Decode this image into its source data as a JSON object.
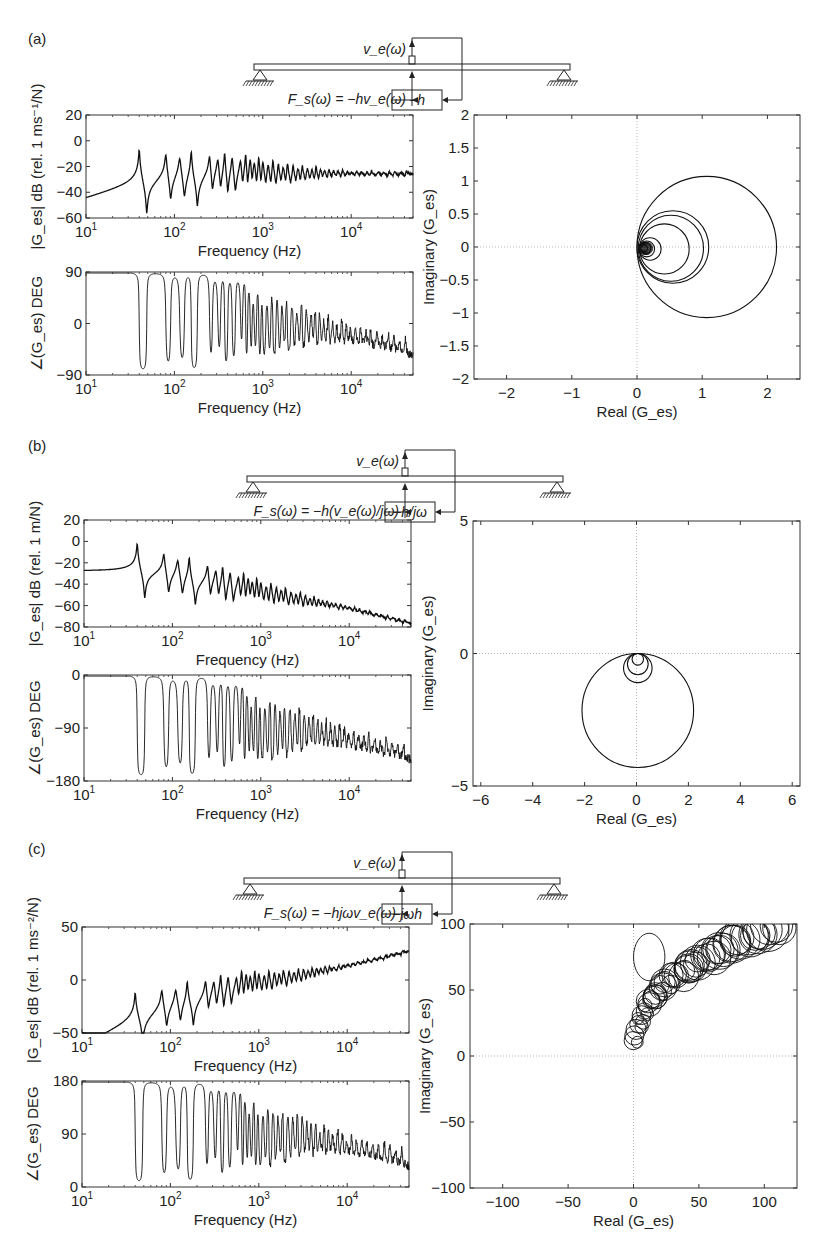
{
  "panels": [
    {
      "label": "(a)",
      "diagram": {
        "sensor_label": "v_e(ω)",
        "force_label": "F_s(ω) = −hv_e(ω)",
        "controller_label": "−h"
      }
    },
    {
      "label": "(b)",
      "diagram": {
        "sensor_label": "v_e(ω)",
        "force_label": "F_s(ω) = −h(v_e(ω)/jω)",
        "controller_label": "−h/jω"
      }
    },
    {
      "label": "(c)",
      "diagram": {
        "sensor_label": "v_e(ω)",
        "force_label": "F_s(ω) = −hjωv_e(ω)",
        "controller_label": "−jωh"
      }
    }
  ],
  "chart_data": [
    {
      "id": "a-magnitude",
      "type": "line",
      "title": "",
      "xlabel": "Frequency (Hz)",
      "ylabel": "|G_es| dB (rel. 1 ms⁻¹/N)",
      "xscale": "log",
      "xlim": [
        10,
        50000
      ],
      "ylim": [
        -60,
        20
      ],
      "xticks": [
        "10¹",
        "10²",
        "10³",
        "10⁴"
      ],
      "yticks": [
        20,
        0,
        -20,
        -40,
        -60
      ],
      "trend": "peaks ~+5 dB at 40 Hz, antiresonances to ~-50 dB, settles near -25 dB at high frequency",
      "resonance_peaks_hz": [
        40,
        80,
        115,
        155,
        250,
        310,
        370,
        450
      ],
      "peak_values_db": [
        6,
        -1,
        0,
        -3,
        -10,
        -10,
        -13,
        -9
      ],
      "antiresonance_values_db": [
        -51,
        -41,
        -43,
        -49,
        -40,
        -40,
        -47
      ],
      "high_freq_level_db": -25
    },
    {
      "id": "a-phase",
      "type": "line",
      "xlabel": "Frequency (Hz)",
      "ylabel": "∠(G_es) DEG",
      "xscale": "log",
      "xlim": [
        10,
        50000
      ],
      "ylim": [
        -90,
        90
      ],
      "xticks": [
        "10¹",
        "10²",
        "10³",
        "10⁴"
      ],
      "yticks": [
        90,
        0,
        -90
      ],
      "start_deg": 90,
      "end_deg": -45,
      "trend": "starts at +90°, oscillates between ±90° at resonances, decays toward about -45° at 50 kHz"
    },
    {
      "id": "a-nyquist",
      "type": "line",
      "xlabel": "Real (G_es)",
      "ylabel": "Imaginary (G_es)",
      "xlim": [
        -2.5,
        2.5
      ],
      "ylim": [
        -2,
        2
      ],
      "xticks": [
        -2,
        -1,
        0,
        1,
        2
      ],
      "yticks": [
        2,
        1.5,
        1,
        0.5,
        0,
        -0.5,
        -1,
        -1.5,
        -2
      ],
      "circles": [
        {
          "cx": 1.07,
          "cy": 0,
          "r": 1.07
        },
        {
          "cx": 0.55,
          "cy": 0,
          "r": 0.55
        },
        {
          "cx": 0.52,
          "cy": -0.02,
          "r": 0.5
        },
        {
          "cx": 0.42,
          "cy": -0.03,
          "r": 0.38
        },
        {
          "cx": 0.2,
          "cy": -0.03,
          "r": 0.17
        },
        {
          "cx": 0.15,
          "cy": -0.03,
          "r": 0.12
        },
        {
          "cx": 0.12,
          "cy": -0.02,
          "r": 0.09
        },
        {
          "cx": 0.1,
          "cy": -0.02,
          "r": 0.06
        }
      ]
    },
    {
      "id": "b-magnitude",
      "type": "line",
      "xlabel": "Frequency (Hz)",
      "ylabel": "|G_es| dB (rel. 1 m/N)",
      "xscale": "log",
      "xlim": [
        10,
        50000
      ],
      "ylim": [
        -80,
        20
      ],
      "xticks": [
        "10¹",
        "10²",
        "10³",
        "10⁴"
      ],
      "yticks": [
        20,
        0,
        -20,
        -40,
        -60,
        -80
      ],
      "start_db": -17,
      "peak_at_40hz_db": 12,
      "end_db": -80,
      "trend": "flat ~-17 dB, peak ~+12 dB at 40 Hz, then declines ~ -20 dB/decade to -80 dB at 50 kHz"
    },
    {
      "id": "b-phase",
      "type": "line",
      "xlabel": "Frequency (Hz)",
      "ylabel": "∠(G_es) DEG",
      "xscale": "log",
      "xlim": [
        10,
        50000
      ],
      "ylim": [
        -180,
        0
      ],
      "xticks": [
        "10¹",
        "10²",
        "10³",
        "10⁴"
      ],
      "yticks": [
        0,
        -90,
        -180
      ],
      "start_deg": 0,
      "end_deg": -135
    },
    {
      "id": "b-nyquist",
      "type": "line",
      "xlabel": "Real (G_es)",
      "ylabel": "Imaginary (G_es)",
      "xlim": [
        -6.3,
        6.3
      ],
      "ylim": [
        -5,
        5
      ],
      "xticks": [
        -6,
        -4,
        -2,
        0,
        2,
        4,
        6
      ],
      "yticks": [
        5,
        0,
        -5
      ],
      "circles": [
        {
          "cx": 0.05,
          "cy": -2.15,
          "r": 2.15
        },
        {
          "cx": 0.05,
          "cy": -0.55,
          "r": 0.55
        },
        {
          "cx": 0.05,
          "cy": -0.4,
          "r": 0.4
        },
        {
          "cx": 0.05,
          "cy": -0.22,
          "r": 0.22
        }
      ]
    },
    {
      "id": "c-magnitude",
      "type": "line",
      "xlabel": "Frequency (Hz)",
      "ylabel": "|G_es| dB (rel. 1 ms⁻²/N)",
      "xscale": "log",
      "xlim": [
        10,
        50000
      ],
      "ylim": [
        -50,
        50
      ],
      "xticks": [
        "10¹",
        "10²",
        "10³",
        "10⁴"
      ],
      "yticks": [
        50,
        0,
        -50
      ],
      "start_db": -42,
      "peak_at_40hz_db": 11,
      "end_db": 44,
      "trend": "rises from -42 dB, resonant peaks ~+12 dB, then climbs ~ +20 dB/decade to ~44 dB at 50 kHz"
    },
    {
      "id": "c-phase",
      "type": "line",
      "xlabel": "Frequency (Hz)",
      "ylabel": "∠(G_es) DEG",
      "xscale": "log",
      "xlim": [
        10,
        50000
      ],
      "ylim": [
        0,
        180
      ],
      "xticks": [
        "10¹",
        "10²",
        "10³",
        "10⁴"
      ],
      "yticks": [
        180,
        90,
        0
      ],
      "start_deg": 178,
      "end_deg": 45
    },
    {
      "id": "c-nyquist",
      "type": "line",
      "xlabel": "Real (G_es)",
      "ylabel": "Imaginary (G_es)",
      "xlim": [
        -125,
        125
      ],
      "ylim": [
        -100,
        100
      ],
      "xticks": [
        -100,
        -50,
        0,
        50,
        100
      ],
      "yticks": [
        100,
        50,
        0,
        -50,
        -100
      ],
      "trend": "cluster of small circles near origin spiralling up and right to beyond (100, 100)"
    }
  ]
}
